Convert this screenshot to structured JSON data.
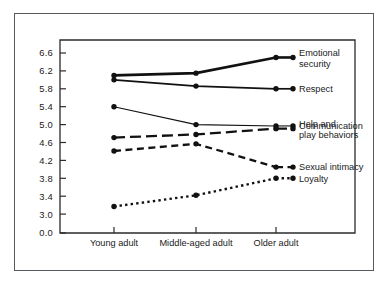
{
  "chart_data": {
    "type": "line",
    "title": "",
    "subtitle": "",
    "xlabel": "",
    "ylabel": "",
    "categories": [
      "Young adult",
      "Middle-aged adult",
      "Older adult"
    ],
    "ylim": [
      3.0,
      6.8
    ],
    "y_axis_has_break": true,
    "y_break_label": "0.0",
    "ytick_labels": [
      "6.6",
      "6.2",
      "5.8",
      "5.4",
      "5.0",
      "4.6",
      "4.2",
      "3.8",
      "3.4",
      "3.0",
      "0.0"
    ],
    "ytick_values": [
      6.6,
      6.2,
      5.8,
      5.4,
      5.0,
      4.6,
      4.2,
      3.8,
      3.4,
      3.0
    ],
    "grid": false,
    "legend_position": "right-inline",
    "series": [
      {
        "name": "Emotional security",
        "label_lines": [
          "Emotional",
          "security"
        ],
        "values": [
          6.1,
          6.15,
          6.5
        ],
        "style": "solid",
        "width": 2.6,
        "color": "#111111"
      },
      {
        "name": "Respect",
        "label_lines": [
          "Respect"
        ],
        "values": [
          6.0,
          5.86,
          5.8
        ],
        "style": "solid",
        "width": 1.7,
        "color": "#111111"
      },
      {
        "name": "Communication",
        "label_lines": [
          "Communication"
        ],
        "values": [
          5.4,
          5.0,
          4.97
        ],
        "style": "solid",
        "width": 1.1,
        "color": "#111111"
      },
      {
        "name": "Help and play behaviors",
        "label_lines": [
          "Help and",
          "play behaviors"
        ],
        "values": [
          4.71,
          4.78,
          4.91
        ],
        "style": "long-dash",
        "width": 2.3,
        "color": "#111111"
      },
      {
        "name": "Sexual intimacy",
        "label_lines": [
          "Sexual intimacy"
        ],
        "values": [
          4.41,
          4.57,
          4.05
        ],
        "style": "dash",
        "width": 2.3,
        "color": "#111111"
      },
      {
        "name": "Loyalty",
        "label_lines": [
          "Loyalty"
        ],
        "values": [
          3.17,
          3.42,
          3.8
        ],
        "style": "dotted",
        "width": 2.4,
        "color": "#111111"
      }
    ]
  },
  "figure": {
    "frame_color": "#555a5e",
    "axis_color": "#2b2b2b",
    "background": "#ffffff"
  }
}
